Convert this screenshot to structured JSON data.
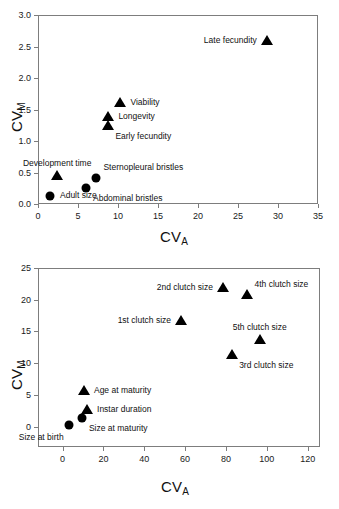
{
  "figure": {
    "panels": [
      {
        "id": "top",
        "chart_data": {
          "type": "scatter",
          "title": "",
          "xlabel": "CV_A",
          "ylabel": "CV_M",
          "xlim": [
            0,
            35
          ],
          "ylim": [
            0.0,
            3.0
          ],
          "xticks": [
            "0",
            "5",
            "10",
            "15",
            "20",
            "25",
            "30",
            "35"
          ],
          "yticks": [
            "0.0",
            "0.5",
            "1.0",
            "1.5",
            "2.0",
            "2.5",
            "3.0"
          ],
          "grid": false,
          "legend": "none",
          "points": [
            {
              "label": "Late fecundity",
              "x": 28.6,
              "y": 2.59,
              "marker": "triangle",
              "label_pos": "left"
            },
            {
              "label": "Viability",
              "x": 10.3,
              "y": 1.6,
              "marker": "triangle",
              "label_pos": "right"
            },
            {
              "label": "Longevity",
              "x": 8.8,
              "y": 1.38,
              "marker": "triangle",
              "label_pos": "right"
            },
            {
              "label": "Early fecundity",
              "x": 8.8,
              "y": 1.24,
              "marker": "triangle",
              "label_pos": "belowright"
            },
            {
              "label": "Development time",
              "x": 2.4,
              "y": 0.44,
              "marker": "triangle",
              "label_pos": "above"
            },
            {
              "label": "Sternopleural bristles",
              "x": 7.3,
              "y": 0.41,
              "marker": "circle",
              "label_pos": "aboveright"
            },
            {
              "label": "Abdominal bristles",
              "x": 6.0,
              "y": 0.25,
              "marker": "circle",
              "label_pos": "belowright"
            },
            {
              "label": "Adult size",
              "x": 1.5,
              "y": 0.13,
              "marker": "circle",
              "label_pos": "right"
            }
          ]
        }
      },
      {
        "id": "bottom",
        "chart_data": {
          "type": "scatter",
          "title": "",
          "xlabel": "CV_A",
          "ylabel": "CV_M",
          "xlim": [
            -12,
            126
          ],
          "ylim": [
            -3.2,
            25
          ],
          "xticks": [
            "0",
            "20",
            "40",
            "60",
            "80",
            "100",
            "120"
          ],
          "yticks": [
            "0",
            "5",
            "10",
            "15",
            "20",
            "25"
          ],
          "grid": false,
          "legend": "none",
          "points": [
            {
              "label": "2nd clutch size",
              "x": 78.5,
              "y": 21.9,
              "marker": "triangle",
              "label_pos": "left"
            },
            {
              "label": "4th clutch size",
              "x": 90.5,
              "y": 20.7,
              "marker": "triangle",
              "label_pos": "aboveright"
            },
            {
              "label": "1st clutch size",
              "x": 58.0,
              "y": 16.7,
              "marker": "triangle",
              "label_pos": "left"
            },
            {
              "label": "5th clutch size",
              "x": 96.5,
              "y": 13.6,
              "marker": "triangle",
              "label_pos": "above"
            },
            {
              "label": "3rd clutch size",
              "x": 83.0,
              "y": 11.3,
              "marker": "triangle",
              "label_pos": "belowright"
            },
            {
              "label": "Age at maturity",
              "x": 10.5,
              "y": 5.6,
              "marker": "triangle",
              "label_pos": "right"
            },
            {
              "label": "Instar duration",
              "x": 12.0,
              "y": 2.7,
              "marker": "triangle",
              "label_pos": "right"
            },
            {
              "label": "Size at maturity",
              "x": 9.5,
              "y": 1.4,
              "marker": "circle",
              "label_pos": "belowright"
            },
            {
              "label": "Size at birth",
              "x": 3.0,
              "y": 0.2,
              "marker": "circle",
              "label_pos": "belowleft"
            }
          ]
        }
      }
    ]
  },
  "axis_titles": {
    "x_main": "CV",
    "x_sub": "A",
    "y_main": "CV",
    "y_sub": "M"
  }
}
